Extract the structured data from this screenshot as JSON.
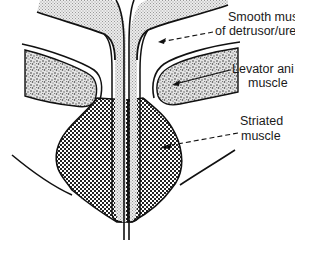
{
  "figure": {
    "type": "anatomical cross-section diagram",
    "labels": {
      "smooth_muscle": {
        "line1": "Smooth muscle",
        "line2": "of detrusor/urethra"
      },
      "levator_ani": {
        "line1": "Levator ani",
        "line2": "muscle"
      },
      "striated_muscle": {
        "line1": "Striated",
        "line2": "muscle"
      }
    },
    "colors": {
      "outline": "#111111",
      "smooth_fill": "#d9d9d9",
      "levator_fill": "#c8c8c8",
      "striated_fill": "#7a7a7a",
      "background": "#ffffff"
    }
  }
}
